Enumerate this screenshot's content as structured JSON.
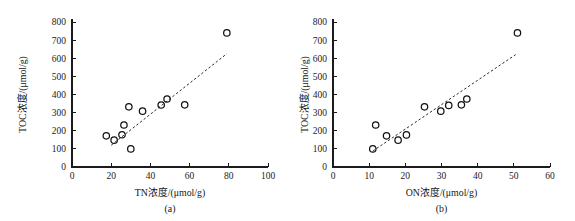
{
  "figure": {
    "background_color": "#ffffff",
    "point_color": "#111111",
    "axis_color": "#1b1b1b",
    "fit_line_color": "#2b2b2b"
  },
  "chart_data": [
    {
      "type": "scatter",
      "panel_label": "(a)",
      "title": "",
      "xlabel": "TN浓度/(μmol/g)",
      "ylabel": "TOC浓度/(μmol/g)",
      "xlim": [
        0,
        100
      ],
      "ylim": [
        0,
        800
      ],
      "xticks": [
        0,
        20,
        40,
        60,
        80,
        100
      ],
      "yticks": [
        0,
        100,
        200,
        300,
        400,
        500,
        600,
        700,
        800
      ],
      "grid": false,
      "legend": "none",
      "marker": "open-circle",
      "points": [
        {
          "x": 17.5,
          "y": 172
        },
        {
          "x": 21.5,
          "y": 148
        },
        {
          "x": 25.5,
          "y": 178
        },
        {
          "x": 26.5,
          "y": 232
        },
        {
          "x": 29.0,
          "y": 332
        },
        {
          "x": 30.0,
          "y": 100
        },
        {
          "x": 36.0,
          "y": 308
        },
        {
          "x": 45.5,
          "y": 342
        },
        {
          "x": 48.5,
          "y": 375
        },
        {
          "x": 57.5,
          "y": 343
        },
        {
          "x": 79.0,
          "y": 740
        }
      ],
      "fit_line": {
        "style": "dashed",
        "x_start": 20.0,
        "y_start": 120,
        "x_end": 79.0,
        "y_end": 625
      }
    },
    {
      "type": "scatter",
      "panel_label": "(b)",
      "title": "",
      "xlabel": "ON浓度/(μmol/g)",
      "ylabel": "TOC浓度/(μmol/g)",
      "xlim": [
        0,
        60
      ],
      "ylim": [
        0,
        800
      ],
      "xticks": [
        0,
        10,
        20,
        30,
        40,
        50,
        60
      ],
      "yticks": [
        0,
        100,
        200,
        300,
        400,
        500,
        600,
        700,
        800
      ],
      "grid": false,
      "legend": "none",
      "marker": "open-circle",
      "points": [
        {
          "x": 11.0,
          "y": 100
        },
        {
          "x": 11.8,
          "y": 232
        },
        {
          "x": 14.8,
          "y": 172
        },
        {
          "x": 18.0,
          "y": 148
        },
        {
          "x": 20.3,
          "y": 177
        },
        {
          "x": 25.3,
          "y": 332
        },
        {
          "x": 29.8,
          "y": 308
        },
        {
          "x": 32.0,
          "y": 340
        },
        {
          "x": 35.5,
          "y": 343
        },
        {
          "x": 37.0,
          "y": 375
        },
        {
          "x": 51.0,
          "y": 740
        }
      ],
      "fit_line": {
        "style": "dashed",
        "x_start": 11.0,
        "y_start": 88,
        "x_end": 50.5,
        "y_end": 620
      }
    }
  ]
}
